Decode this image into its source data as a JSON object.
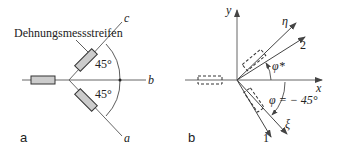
{
  "panel_a": {
    "label": "a",
    "gauge_label": "Dehnungsmessstreifen",
    "axes": [
      "a",
      "b",
      "c"
    ],
    "angle_upper": "45°",
    "angle_lower": "45°"
  },
  "panel_b": {
    "label": "b",
    "axis_x": "x",
    "axis_y": "y",
    "axis_eta": "η",
    "axis_xi": "ξ",
    "axis_1": "1",
    "axis_2": "2",
    "angle_phi_star": "φ*",
    "angle_phi": "φ = − 45°"
  },
  "colors": {
    "gauge_fill": "#cccccc",
    "line": "#444444"
  }
}
